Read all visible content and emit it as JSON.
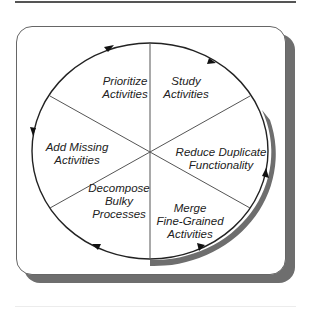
{
  "diagram": {
    "type": "cycle",
    "segments": [
      {
        "id": "study",
        "lines": [
          "Study",
          "Activities"
        ]
      },
      {
        "id": "reduce",
        "lines": [
          "Reduce Duplicate",
          "Functionality"
        ]
      },
      {
        "id": "merge",
        "lines": [
          "Merge",
          "Fine-Grained",
          "Activities"
        ]
      },
      {
        "id": "decompose",
        "lines": [
          "Decompose",
          "Bulky",
          "Processes"
        ]
      },
      {
        "id": "add",
        "lines": [
          "Add Missing",
          "Activities"
        ]
      },
      {
        "id": "prioritize",
        "lines": [
          "Prioritize",
          "Activities"
        ]
      }
    ],
    "direction": "clockwise",
    "colors": {
      "line": "#222222",
      "shadow": "#6e6e6e",
      "frame": "#666666"
    }
  }
}
